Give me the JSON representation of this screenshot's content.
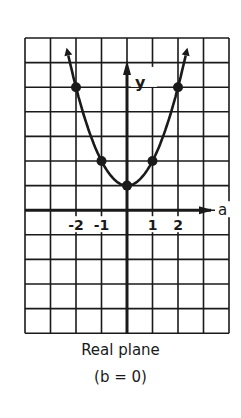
{
  "diagram": {
    "title": "Real plane",
    "subtitle": "(b = 0)",
    "x_axis_label": "a",
    "y_axis_label": "y",
    "tick_labels": [
      "-2",
      "-1",
      "1",
      "2"
    ],
    "function": "y = a^2 + 1",
    "points": [
      {
        "a": -2,
        "y": 5
      },
      {
        "a": -1,
        "y": 2
      },
      {
        "a": 0,
        "y": 1
      },
      {
        "a": 1,
        "y": 2
      },
      {
        "a": 2,
        "y": 5
      }
    ],
    "grid": {
      "columns": 8,
      "rows": 12
    },
    "colors": {
      "ink": "#1a1a1a",
      "background": "#ffffff"
    }
  }
}
